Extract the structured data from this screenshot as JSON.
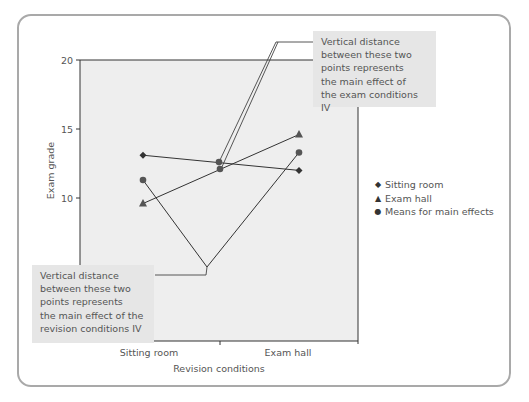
{
  "chart_data": {
    "type": "line",
    "title": "",
    "xlabel": "Revision conditions",
    "ylabel": "Exam grade",
    "categories": [
      "Sitting room",
      "Exam hall"
    ],
    "ylim": [
      0,
      20
    ],
    "y_ticks": [
      10,
      15,
      20
    ],
    "grid": false,
    "legend_position": "right",
    "series": [
      {
        "name": "Sitting room",
        "marker": "diamond",
        "values": [
          13.1,
          12.0
        ]
      },
      {
        "name": "Exam hall",
        "marker": "triangle",
        "values": [
          9.6,
          14.6
        ]
      }
    ],
    "main_effect_means": {
      "name": "Means for main effects",
      "marker": "circle",
      "revision_conditions": {
        "Sitting room": 11.3,
        "Exam hall": 13.3
      },
      "exam_conditions": {
        "Sitting room": 12.6,
        "Exam hall": 12.1
      }
    },
    "legend": [
      {
        "label": "Sitting room",
        "symbol": "◆"
      },
      {
        "label": "Exam hall",
        "symbol": "▲"
      },
      {
        "label": "Means for main effects",
        "symbol": "●"
      }
    ],
    "annotations": [
      {
        "id": "exam",
        "lines": [
          "Vertical distance",
          "between these two",
          "points represents",
          "the main effect of",
          "the exam conditions IV"
        ]
      },
      {
        "id": "revision",
        "lines": [
          "Vertical distance",
          "between these two",
          "points represents",
          "the main effect of the",
          "revision conditions IV"
        ]
      }
    ]
  }
}
